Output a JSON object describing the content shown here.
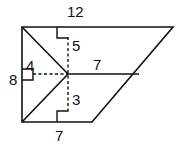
{
  "diagram": {
    "labels": {
      "top": "12",
      "upper_vertical": "5",
      "middle_horizontal": "7",
      "left_short": "4",
      "left_side": "8",
      "lower_vertical": "3",
      "bottom": "7"
    },
    "colors": {
      "stroke": "#111111",
      "background": "#ffffff"
    }
  }
}
